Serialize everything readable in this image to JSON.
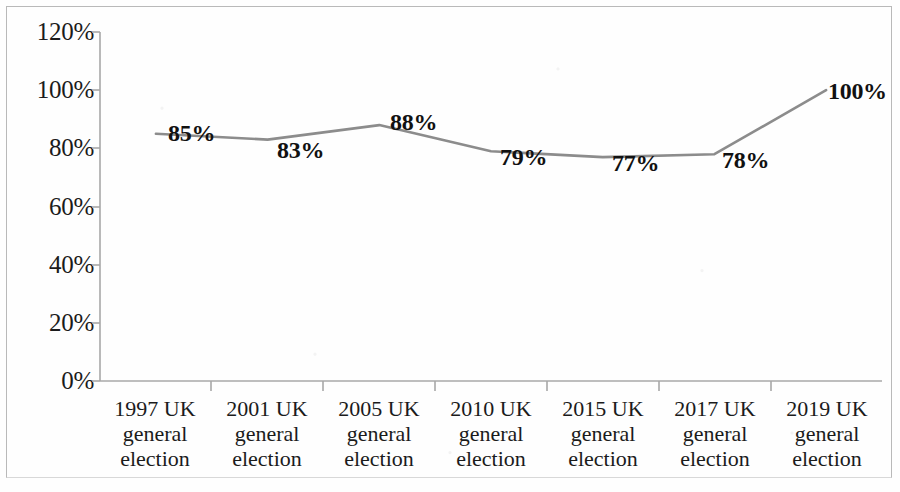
{
  "chart_data": {
    "type": "line",
    "title": "",
    "subtitle": "",
    "xlabel": "",
    "ylabel": "",
    "categories": [
      "1997 UK general election",
      "2001 UK general election",
      "2005 UK general election",
      "2010 UK general election",
      "2015 UK general election",
      "2017 UK general election",
      "2019 UK general election"
    ],
    "category_lines": [
      [
        "1997 UK",
        "general",
        "election"
      ],
      [
        "2001 UK",
        "general",
        "election"
      ],
      [
        "2005 UK",
        "general",
        "election"
      ],
      [
        "2010 UK",
        "general",
        "election"
      ],
      [
        "2015 UK",
        "general",
        "election"
      ],
      [
        "2017 UK",
        "general",
        "election"
      ],
      [
        "2019 UK",
        "general",
        "election"
      ]
    ],
    "values": [
      85,
      83,
      88,
      79,
      77,
      78,
      100
    ],
    "data_labels": [
      "85%",
      "83%",
      "88%",
      "79%",
      "77%",
      "78%",
      "100%"
    ],
    "ylim": [
      0,
      120
    ],
    "ytick_values": [
      120,
      100,
      80,
      60,
      40,
      20,
      0
    ],
    "ytick_labels": [
      "120%",
      "100%",
      "80%",
      "60%",
      "40%",
      "20%",
      "0%"
    ],
    "grid": false,
    "legend": false,
    "legend_position": "none",
    "series_color": "#8c8c8c",
    "axis_color": "#a8a8a8",
    "text_color": "#1b1b1b"
  }
}
